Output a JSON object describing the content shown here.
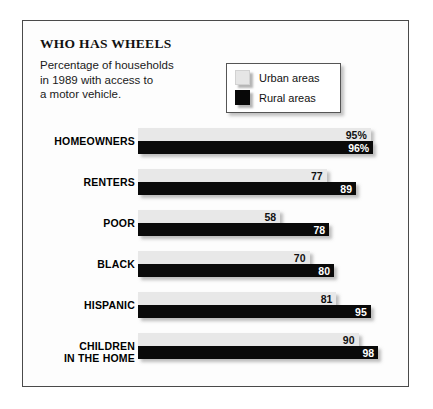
{
  "title": "WHO HAS WHEELS",
  "subtitle": "Percentage of households\nin 1989 with access to\na motor vehicle.",
  "legend": {
    "entries": [
      {
        "label": "Urban areas",
        "swatch": "urban"
      },
      {
        "label": "Rural areas",
        "swatch": "rural"
      }
    ]
  },
  "colors": {
    "urban_bar": "#e8e8e8",
    "rural_bar": "#0a0a0a",
    "frame": "#4a4a4a",
    "background": "#fdfdfd"
  },
  "chart_data": {
    "type": "bar",
    "orientation": "horizontal",
    "title": "WHO HAS WHEELS",
    "subtitle": "Percentage of households in 1989 with access to a motor vehicle.",
    "xlabel": "",
    "ylabel": "",
    "xlim": [
      0,
      100
    ],
    "grid": false,
    "legend_position": "top-right",
    "categories": [
      "HOMEOWNERS",
      "RENTERS",
      "POOR",
      "BLACK",
      "HISPANIC",
      "CHILDREN\nIN THE HOME"
    ],
    "series": [
      {
        "name": "Urban areas",
        "values": [
          95,
          77,
          58,
          70,
          81,
          90
        ]
      },
      {
        "name": "Rural areas",
        "values": [
          96,
          89,
          78,
          80,
          95,
          98
        ]
      }
    ],
    "data_labels": [
      {
        "category": "HOMEOWNERS",
        "urban": "95%",
        "rural": "96%"
      },
      {
        "category": "RENTERS",
        "urban": "77",
        "rural": "89"
      },
      {
        "category": "POOR",
        "urban": "58",
        "rural": "78"
      },
      {
        "category": "BLACK",
        "urban": "70",
        "rural": "80"
      },
      {
        "category": "HISPANIC",
        "urban": "81",
        "rural": "95"
      },
      {
        "category": "CHILDREN IN THE HOME",
        "urban": "90",
        "rural": "98"
      }
    ]
  }
}
